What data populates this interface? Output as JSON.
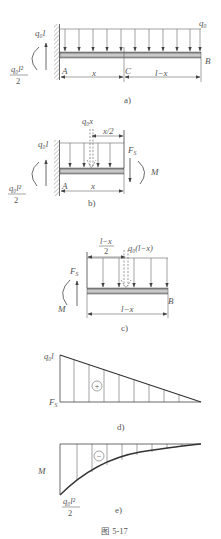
{
  "figure": {
    "caption": "图   5-17",
    "colors": {
      "ink": "#444444",
      "text": "#555555",
      "beam_dark": "#7a7a7a",
      "beam_light": "#cfcfcf",
      "background": "#ffffff"
    }
  },
  "panel_a": {
    "label": "a)",
    "load_label": "q₀",
    "reaction_force": "q₀l",
    "reaction_moment_num": "q₀l²",
    "reaction_moment_den": "2",
    "point_A": "A",
    "point_B": "B",
    "point_C": "C",
    "dim_x": "x",
    "dim_lx": "l−x"
  },
  "panel_b": {
    "label": "b)",
    "resultant": "q₀x",
    "dim_half": "x/2",
    "reaction_force": "q₀l",
    "reaction_moment_num": "q₀l²",
    "reaction_moment_den": "2",
    "shear": "F",
    "shear_sub": "S",
    "moment": "M",
    "point_A": "A",
    "dim_x": "x"
  },
  "panel_c": {
    "label": "c)",
    "dim_half_num": "l−x",
    "dim_half_den": "2",
    "resultant": "q₀(l−x)",
    "shear": "F",
    "shear_sub": "S",
    "moment": "M",
    "point_B": "B",
    "dim_lx": "l−x"
  },
  "panel_d": {
    "label": "d)",
    "max_value": "q₀l",
    "axis": "F",
    "axis_sub": "S",
    "sign": "+"
  },
  "panel_e": {
    "label": "e)",
    "axis": "M",
    "sign": "−",
    "max_num": "q₀l²",
    "max_den": "2"
  }
}
